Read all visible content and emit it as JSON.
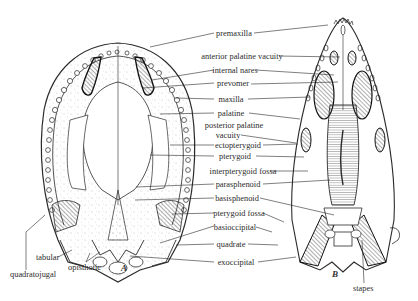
{
  "figure": {
    "panels": [
      {
        "id": "A",
        "label": "A"
      },
      {
        "id": "B",
        "label": "B"
      }
    ],
    "labels": {
      "premaxilla": "premaxilla",
      "anterior_palatine_vacuity": "anterior palatine vacuity",
      "internal_nares": "internal nares",
      "prevomer": "prevomer",
      "maxilla": "maxilla",
      "palatine": "palatine",
      "posterior_palatine_vacuity_1": "posterior palatine",
      "posterior_palatine_vacuity_2": "vacuity",
      "ectopterygoid": "ectopterygoid",
      "pterygoid": "pterygoid",
      "interpterygoid_fossa": "interpterygoid fossa",
      "parasphenoid": "parasphenoid",
      "basisphenoid": "basisphenoid",
      "pterygoid_fossa": "pterygoid fossa",
      "basioccipital": "basioccipital",
      "quadrate": "quadrate",
      "exoccipital": "exoccipital",
      "tabular": "tabular",
      "quadratojugal": "quadratojugal",
      "opisthotic": "opisthotic",
      "stapes": "stapes"
    },
    "colors": {
      "ink": "#2a2a2a",
      "paper": "#ffffff",
      "stipple": "#8a8a8a"
    }
  }
}
